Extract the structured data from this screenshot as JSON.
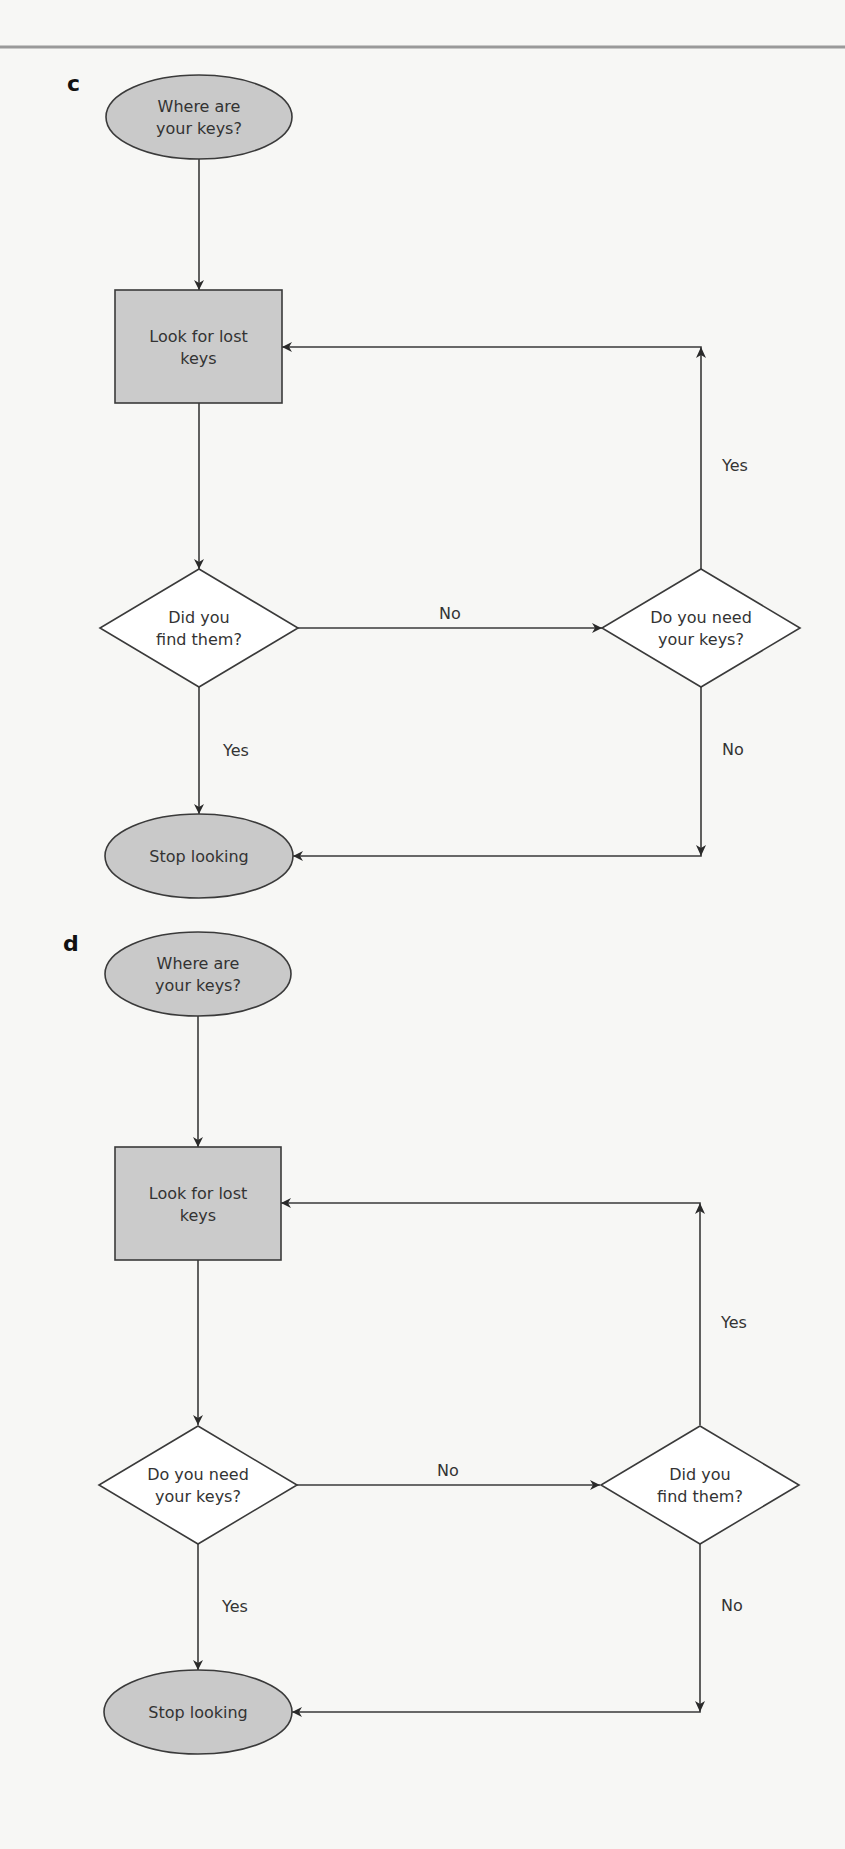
{
  "rule": {
    "y": 47,
    "x1": 0,
    "x2": 845,
    "color": "#9a9a9a"
  },
  "colors": {
    "background": "#f7f7f5",
    "terminal_fill": "#c9c9c9",
    "process_fill": "#cbcbcb",
    "decision_fill": "#ffffff",
    "stroke": "#3a3a3a",
    "text": "#333333"
  },
  "panels": [
    {
      "id": "c",
      "label": "c",
      "label_pos": [
        67,
        91
      ],
      "nodes": [
        {
          "id": "start",
          "type": "terminal",
          "cx": 199,
          "cy": 117,
          "rx": 93,
          "ry": 42,
          "lines": [
            "Where are",
            "your keys?"
          ]
        },
        {
          "id": "look",
          "type": "process",
          "x": 115,
          "y": 290,
          "w": 167,
          "h": 113,
          "lines": [
            "Look for lost",
            "keys"
          ]
        },
        {
          "id": "q1",
          "type": "decision",
          "cx": 199,
          "cy": 628,
          "hw": 99,
          "hh": 59,
          "lines": [
            "Did you",
            "find them?"
          ]
        },
        {
          "id": "q2",
          "type": "decision",
          "cx": 701,
          "cy": 628,
          "hw": 99,
          "hh": 59,
          "lines": [
            "Do you need",
            "your keys?"
          ]
        },
        {
          "id": "stop",
          "type": "terminal",
          "cx": 199,
          "cy": 856,
          "rx": 94,
          "ry": 42,
          "lines": [
            "Stop looking"
          ]
        }
      ],
      "edges": [
        {
          "points": [
            [
              199,
              159
            ],
            [
              199,
              290
            ]
          ],
          "label": ""
        },
        {
          "points": [
            [
              199,
              403
            ],
            [
              199,
              569
            ]
          ],
          "label": ""
        },
        {
          "points": [
            [
              297,
              628
            ],
            [
              602,
              628
            ]
          ],
          "label": "No",
          "label_pos": [
            450,
            619
          ]
        },
        {
          "points": [
            [
              701,
              569
            ],
            [
              701,
              347
            ],
            [
              282,
              347
            ]
          ],
          "label": "Yes",
          "label_pos": [
            722,
            471
          ],
          "mid_arrow": [
            701,
            347,
            "up"
          ]
        },
        {
          "points": [
            [
              199,
              687
            ],
            [
              199,
              814
            ]
          ],
          "label": "Yes",
          "label_pos": [
            223,
            756
          ]
        },
        {
          "points": [
            [
              701,
              687
            ],
            [
              701,
              856
            ],
            [
              293,
              856
            ]
          ],
          "label": "No",
          "label_pos": [
            722,
            755
          ],
          "mid_arrow": [
            701,
            856,
            "down"
          ]
        }
      ]
    },
    {
      "id": "d",
      "label": "d",
      "label_pos": [
        63,
        951
      ],
      "nodes": [
        {
          "id": "start",
          "type": "terminal",
          "cx": 198,
          "cy": 974,
          "rx": 93,
          "ry": 42,
          "lines": [
            "Where are",
            "your keys?"
          ]
        },
        {
          "id": "look",
          "type": "process",
          "x": 115,
          "y": 1147,
          "w": 166,
          "h": 113,
          "lines": [
            "Look for lost",
            "keys"
          ]
        },
        {
          "id": "q1",
          "type": "decision",
          "cx": 198,
          "cy": 1485,
          "hw": 99,
          "hh": 59,
          "lines": [
            "Do you need",
            "your keys?"
          ]
        },
        {
          "id": "q2",
          "type": "decision",
          "cx": 700,
          "cy": 1485,
          "hw": 99,
          "hh": 59,
          "lines": [
            "Did you",
            "find them?"
          ]
        },
        {
          "id": "stop",
          "type": "terminal",
          "cx": 198,
          "cy": 1712,
          "rx": 94,
          "ry": 42,
          "lines": [
            "Stop looking"
          ]
        }
      ],
      "edges": [
        {
          "points": [
            [
              198,
              1016
            ],
            [
              198,
              1147
            ]
          ],
          "label": ""
        },
        {
          "points": [
            [
              198,
              1260
            ],
            [
              198,
              1425
            ]
          ],
          "label": ""
        },
        {
          "points": [
            [
              296,
              1485
            ],
            [
              600,
              1485
            ]
          ],
          "label": "No",
          "label_pos": [
            448,
            1476
          ]
        },
        {
          "points": [
            [
              700,
              1425
            ],
            [
              700,
              1203
            ],
            [
              281,
              1203
            ]
          ],
          "label": "Yes",
          "label_pos": [
            721,
            1328
          ],
          "mid_arrow": [
            700,
            1203,
            "up"
          ]
        },
        {
          "points": [
            [
              198,
              1544
            ],
            [
              198,
              1670
            ]
          ],
          "label": "Yes",
          "label_pos": [
            222,
            1612
          ]
        },
        {
          "points": [
            [
              700,
              1544
            ],
            [
              700,
              1712
            ],
            [
              292,
              1712
            ]
          ],
          "label": "No",
          "label_pos": [
            721,
            1611
          ],
          "mid_arrow": [
            700,
            1712,
            "down"
          ]
        }
      ]
    }
  ]
}
